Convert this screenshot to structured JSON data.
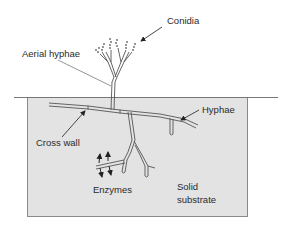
{
  "diagram": {
    "type": "fungal growth on solid substrate",
    "colors": {
      "background": "#ffffff",
      "substrate_fill": "#e3e3e3",
      "substrate_border": "#8a8a8a",
      "line": "#555555",
      "hyphae_fill": "#f4f4f4",
      "text": "#2a2a2a"
    },
    "labels": {
      "conidia": "Conidia",
      "aerial_hyphae": "Aerial hyphae",
      "hyphae": "Hyphae",
      "cross_wall": "Cross wall",
      "enzymes": "Enzymes",
      "substrate_line1": "Solid",
      "substrate_line2": "substrate"
    }
  }
}
